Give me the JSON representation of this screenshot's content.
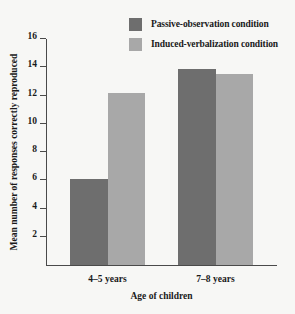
{
  "chart_data": {
    "type": "bar",
    "title": "",
    "xlabel": "Age of children",
    "ylabel": "Mean number of responses correctly reproduced",
    "categories": [
      "4–5 years",
      "7–8 years"
    ],
    "series": [
      {
        "name": "Passive-observation condition",
        "color": "#6e6e6e",
        "values": [
          6.1,
          13.9
        ]
      },
      {
        "name": "Induced-verbalization condition",
        "color": "#a8a8a8",
        "values": [
          12.2,
          13.5
        ]
      }
    ],
    "ylim": [
      0,
      16
    ],
    "yticks": [
      2,
      4,
      6,
      8,
      10,
      12,
      14,
      16
    ],
    "ytick_labels": [
      "2",
      "4",
      "6",
      "8",
      "10",
      "12",
      "14",
      "16"
    ],
    "grid": false,
    "legend_position": "top-right",
    "background_color": "#f7f7f5",
    "axis_color": "#4a4a4a"
  }
}
